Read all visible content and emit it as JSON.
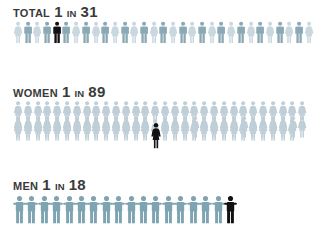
{
  "background_color": "#ffffff",
  "colors": {
    "text": "#3a3a3a",
    "figure_teal": "#8aa9b5",
    "figure_light": "#c3d2da",
    "figure_pale": "#bfced7",
    "highlight": "#111111"
  },
  "rows": [
    {
      "id": "total",
      "category_label": "TOTAL",
      "ratio_numerator": "1",
      "ratio_connector": "IN",
      "ratio_denominator": "31",
      "ratio_text": "1 IN 31",
      "icon_name": "person-icon",
      "total_figures": 31,
      "highlight_index": 5,
      "figure_style": "alternating-male-female",
      "figure_color_a": "#8aa9b5",
      "figure_color_b": "#c9d7de",
      "highlight_color": "#111111",
      "layout": "single-line"
    },
    {
      "id": "women",
      "category_label": "WOMEN",
      "ratio_numerator": "1",
      "ratio_connector": "IN",
      "ratio_denominator": "89",
      "ratio_text": "1 IN 89",
      "icon_name": "woman-icon",
      "total_figures": 89,
      "highlight_index": 45,
      "figure_style": "female",
      "figure_color_a": "#bfced7",
      "figure_color_b": "#bfced7",
      "highlight_color": "#111111",
      "layout": "stacked-three-deep"
    },
    {
      "id": "men",
      "category_label": "MEN",
      "ratio_numerator": "1",
      "ratio_connector": "IN",
      "ratio_denominator": "18",
      "ratio_text": "1 IN 18",
      "icon_name": "man-icon",
      "total_figures": 18,
      "highlight_index": 18,
      "figure_style": "male-arms-out",
      "figure_color_a": "#7ea4b2",
      "figure_color_b": "#7ea4b2",
      "highlight_color": "#111111",
      "layout": "single-line"
    }
  ],
  "chart_data": {
    "type": "pictogram",
    "title": "",
    "categories": [
      "TOTAL",
      "WOMEN",
      "MEN"
    ],
    "values": [
      31,
      89,
      18
    ],
    "value_labels": [
      "1 IN 31",
      "1 IN 89",
      "1 IN 18"
    ],
    "highlighted_per_category": [
      1,
      1,
      1
    ],
    "unit_icon": "person-icon",
    "xlabel": "",
    "ylabel": "",
    "legend": []
  }
}
